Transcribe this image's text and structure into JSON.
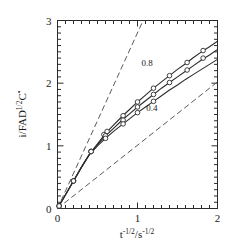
{
  "chart_data": {
    "type": "line",
    "title": "",
    "subtitle": "",
    "xlabel": "t^-1/2 / s^-1/2",
    "xlabel_parts": {
      "base1": "t",
      "exp1": "-1/2",
      "slash": "/",
      "base2": "s",
      "exp2": "-1/2"
    },
    "ylabel": "i/FAD^1/2 C*",
    "ylabel_parts": {
      "lead": "i/FAD",
      "exp": "1/2",
      "tail": "C",
      "star": "•"
    },
    "xlim": [
      0,
      2
    ],
    "ylim": [
      0,
      3
    ],
    "xticks": [
      0,
      1,
      2
    ],
    "xticklabels": [
      "0",
      "1",
      "2"
    ],
    "yticks": [
      0,
      1,
      2,
      3
    ],
    "yticklabels": [
      "0",
      "1",
      "2",
      "3"
    ],
    "x_minor_tick_step": 0.1,
    "y_minor_tick_step": 0.1,
    "grid": false,
    "legend": null,
    "annotations": [
      {
        "text": "0.8",
        "x": 1.12,
        "y": 2.28
      },
      {
        "text": "0.4",
        "x": 1.18,
        "y": 1.55
      }
    ],
    "series": [
      {
        "name": "upper-solid-curve",
        "style": "solid",
        "marker": "open-circle",
        "x": [
          0.0,
          0.1,
          0.2,
          0.3,
          0.4,
          0.5,
          0.6,
          0.7,
          0.8,
          0.9,
          1.0,
          1.1,
          1.2,
          1.3,
          1.4,
          1.5,
          1.6,
          1.7,
          1.8,
          1.9,
          2.0
        ],
        "y": [
          0.0,
          0.22,
          0.44,
          0.66,
          0.87,
          1.03,
          1.2,
          1.33,
          1.46,
          1.58,
          1.7,
          1.81,
          1.92,
          2.02,
          2.12,
          2.22,
          2.31,
          2.41,
          2.5,
          2.58,
          2.67
        ],
        "markers_x": [
          0.02,
          0.2,
          0.42,
          0.58,
          0.62,
          0.82,
          1.0,
          1.2,
          1.4,
          1.62,
          1.82
        ],
        "markers_y": [
          0.04,
          0.44,
          0.91,
          1.18,
          1.23,
          1.48,
          1.7,
          1.92,
          2.12,
          2.33,
          2.52
        ]
      },
      {
        "name": "middle-solid-curve",
        "style": "solid",
        "marker": "open-circle",
        "x": [
          0.0,
          0.1,
          0.2,
          0.3,
          0.4,
          0.5,
          0.6,
          0.7,
          0.8,
          0.9,
          1.0,
          1.1,
          1.2,
          1.3,
          1.4,
          1.5,
          1.6,
          1.7,
          1.8,
          1.9,
          2.0
        ],
        "y": [
          0.0,
          0.22,
          0.44,
          0.66,
          0.87,
          1.02,
          1.16,
          1.28,
          1.4,
          1.51,
          1.62,
          1.72,
          1.82,
          1.92,
          2.01,
          2.1,
          2.19,
          2.28,
          2.37,
          2.45,
          2.54
        ],
        "markers_x": [
          0.02,
          0.2,
          0.42,
          0.6,
          0.82,
          1.0,
          1.2,
          1.4,
          1.62,
          1.82
        ],
        "markers_y": [
          0.04,
          0.44,
          0.91,
          1.16,
          1.41,
          1.62,
          1.82,
          2.01,
          2.21,
          2.4
        ]
      },
      {
        "name": "lower-solid-curve",
        "style": "solid",
        "marker": "open-circle",
        "x": [
          0.0,
          0.1,
          0.2,
          0.3,
          0.4,
          0.5,
          0.6,
          0.7,
          0.8,
          0.9,
          1.0,
          1.1,
          1.2,
          1.3,
          1.4,
          1.5,
          1.6,
          1.7,
          1.8,
          1.9,
          2.0
        ],
        "y": [
          0.0,
          0.22,
          0.44,
          0.66,
          0.86,
          1.0,
          1.12,
          1.23,
          1.33,
          1.43,
          1.53,
          1.62,
          1.71,
          1.8,
          1.89,
          1.97,
          2.06,
          2.14,
          2.22,
          2.3,
          2.38
        ],
        "markers_x": [
          0.02,
          0.2,
          0.42,
          0.6,
          0.82,
          1.0,
          1.2
        ],
        "markers_y": [
          0.04,
          0.44,
          0.91,
          1.12,
          1.35,
          1.53,
          1.71
        ]
      },
      {
        "name": "steep-dashed-reference-line",
        "style": "dashed",
        "marker": "none",
        "x": [
          0.0,
          1.07
        ],
        "y": [
          0.0,
          3.0
        ]
      },
      {
        "name": "shallow-dashed-reference-line",
        "style": "dashed",
        "marker": "none",
        "x": [
          0.0,
          2.0
        ],
        "y": [
          0.0,
          2.02
        ]
      }
    ]
  },
  "axes": {
    "x_axis_name": "x-axis",
    "y_axis_name": "y-axis"
  },
  "colors": {
    "background": "#ffffff",
    "axis": "#2b2b2b",
    "curve": "#2b2b2b",
    "dashed": "#5a5a5a",
    "text": "#1a1a1a"
  }
}
